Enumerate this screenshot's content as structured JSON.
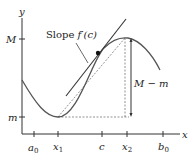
{
  "diagram": {
    "axes": {
      "x_label": "x",
      "y_label": "y",
      "x_ticks": [
        {
          "label": "a",
          "sub": "0",
          "x": 34
        },
        {
          "label": "x",
          "sub": "1",
          "x": 58
        },
        {
          "label": "c",
          "sub": "",
          "x": 102
        },
        {
          "label": "x",
          "sub": "2",
          "x": 127
        },
        {
          "label": "b",
          "sub": "0",
          "x": 163
        }
      ],
      "y_ticks": [
        {
          "label": "M",
          "y": 39
        },
        {
          "label": "m",
          "y": 117
        }
      ]
    },
    "annotations": {
      "slope_prefix": "Slope ",
      "slope_func": "f′(c)",
      "difference_label": "M − m"
    },
    "colors": {
      "curve": "#555555",
      "axis": "#333333",
      "dashed": "#777777",
      "tangent": "#333333"
    }
  }
}
